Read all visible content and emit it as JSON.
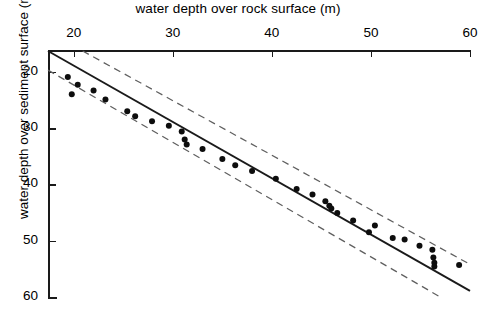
{
  "chart_data": {
    "type": "scatter",
    "title": "",
    "xlabel": "water depth over rock surface (m)",
    "ylabel": "water depth over sediment surface (m)",
    "xlim": [
      17.4,
      60.0
    ],
    "ylim": [
      60.0,
      16.3
    ],
    "y_axis_inverted": true,
    "grid": false,
    "legend": null,
    "xticks": [
      20,
      30,
      40,
      50,
      60
    ],
    "xticklabels": [
      "20",
      "30",
      "40",
      "50",
      "60"
    ],
    "yticks": [
      20,
      30,
      40,
      50,
      60
    ],
    "yticklabels": [
      "20",
      "30",
      "40",
      "50",
      "60"
    ],
    "series": [
      {
        "name": "observations",
        "type": "scatter",
        "marker": "filled-circle",
        "color": "#0d0d0d",
        "points": [
          [
            19.4,
            20.9
          ],
          [
            20.4,
            22.3
          ],
          [
            19.8,
            24.0
          ],
          [
            22.0,
            23.3
          ],
          [
            23.2,
            24.9
          ],
          [
            25.4,
            27.0
          ],
          [
            26.2,
            27.9
          ],
          [
            27.9,
            28.8
          ],
          [
            29.6,
            29.6
          ],
          [
            30.9,
            30.6
          ],
          [
            31.2,
            32.0
          ],
          [
            31.4,
            32.9
          ],
          [
            33.0,
            33.7
          ],
          [
            35.0,
            35.5
          ],
          [
            36.3,
            36.6
          ],
          [
            38.0,
            37.6
          ],
          [
            40.4,
            39.0
          ],
          [
            42.5,
            40.8
          ],
          [
            44.1,
            41.8
          ],
          [
            45.4,
            43.0
          ],
          [
            45.8,
            43.8
          ],
          [
            46.0,
            44.3
          ],
          [
            46.6,
            45.1
          ],
          [
            48.2,
            46.4
          ],
          [
            50.4,
            47.3
          ],
          [
            49.8,
            48.5
          ],
          [
            52.2,
            49.5
          ],
          [
            53.4,
            49.8
          ],
          [
            54.9,
            50.9
          ],
          [
            56.2,
            51.6
          ],
          [
            56.3,
            53.0
          ],
          [
            56.4,
            53.9
          ],
          [
            56.4,
            54.6
          ],
          [
            58.9,
            54.3
          ]
        ]
      },
      {
        "name": "regression-line",
        "type": "line",
        "style": "solid",
        "color": "#1a1a1a",
        "endpoints": [
          [
            17.4,
            16.3
          ],
          [
            60.0,
            58.9
          ]
        ]
      },
      {
        "name": "confidence-band-upper",
        "type": "line",
        "style": "dashed",
        "color": "#5f5f5f",
        "endpoints": [
          [
            20.9,
            16.3
          ],
          [
            60.0,
            54.2
          ]
        ]
      },
      {
        "name": "confidence-band-lower",
        "type": "line",
        "style": "dashed",
        "color": "#5f5f5f",
        "endpoints": [
          [
            17.4,
            19.7
          ],
          [
            57.0,
            60.0
          ]
        ]
      }
    ]
  }
}
